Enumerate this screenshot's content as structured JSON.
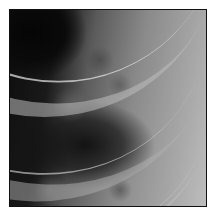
{
  "image": {
    "description": "Grayscale radiograph crop showing curved rib shadows over lung tissue",
    "alt": "Chest X-ray region with ribs",
    "colors": {
      "border": "#111111",
      "dark_region": "#0a0a0a",
      "bright_region": "#bdbdbd",
      "background": "#ffffff"
    }
  }
}
